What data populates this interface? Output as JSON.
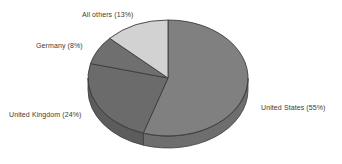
{
  "chart_data": {
    "type": "pie",
    "title": "",
    "subtitle": "",
    "xlabel": "",
    "ylabel": "",
    "legend_position": "none",
    "grid": false,
    "three_d": true,
    "start_angle_deg": 0,
    "direction": "clockwise",
    "background_color": "#ffffff",
    "categories": [
      "United States",
      "United Kingdom",
      "Germany",
      "All others"
    ],
    "values": [
      55,
      24,
      8,
      13
    ],
    "value_unit": "%",
    "slices": [
      {
        "name": "United States",
        "value": 55,
        "label": "United States (55%)",
        "color": "#808080",
        "side_color": "#6e6e6e",
        "label_position": "right"
      },
      {
        "name": "United Kingdom",
        "value": 24,
        "label": "United Kingdom (24%)",
        "color": "#6b6b6b",
        "side_color": "#5c5c5c",
        "label_position": "lower-left"
      },
      {
        "name": "Germany",
        "value": 8,
        "label": "Germany (8%)",
        "color": "#6f6f6f",
        "side_color": "#5f5f5f",
        "label_position": "upper-left"
      },
      {
        "name": "All others",
        "value": 13,
        "label": "All others (13%)",
        "color": "#d2d2d2",
        "side_color": "#bcbcbc",
        "label_position": "top"
      }
    ],
    "outline_color": "#3c3c3c",
    "label_color": "#3a3a3a"
  },
  "labels": {
    "all_others": "All others (13%)",
    "germany": "Germany (8%)",
    "united_kingdom": "United Kingdom (24%)",
    "united_states": "United States (55%)"
  }
}
